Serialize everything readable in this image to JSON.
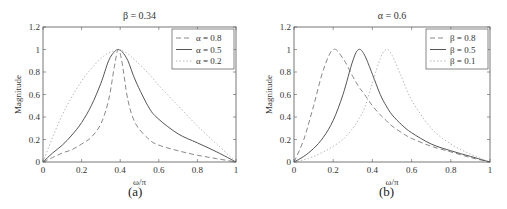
{
  "chart_data": [
    {
      "type": "line",
      "panel_label": "(a)",
      "title": "β = 0.34",
      "xlabel": "ω/π",
      "ylabel": "Magnitude",
      "xlim": [
        0,
        1
      ],
      "ylim": [
        0,
        1.2
      ],
      "xticks": [
        "0",
        "0.2",
        "0.4",
        "0.6",
        "0.8",
        "1"
      ],
      "yticks": [
        "0",
        "0.2",
        "0.4",
        "0.6",
        "0.8",
        "1",
        "1.2"
      ],
      "grid": false,
      "legend_position": "upper right",
      "x": [
        0,
        0.05,
        0.1,
        0.15,
        0.2,
        0.25,
        0.3,
        0.34,
        0.37,
        0.39,
        0.41,
        0.44,
        0.48,
        0.55,
        0.6,
        0.7,
        0.8,
        0.9,
        1.0
      ],
      "series": [
        {
          "name": "α = 0.8",
          "style": "dashed",
          "color": "#888888",
          "values": [
            0,
            0.04,
            0.08,
            0.11,
            0.16,
            0.22,
            0.34,
            0.55,
            0.85,
            1.0,
            0.88,
            0.55,
            0.34,
            0.2,
            0.15,
            0.1,
            0.06,
            0.03,
            0
          ]
        },
        {
          "name": "α = 0.5",
          "style": "solid",
          "color": "#555555",
          "values": [
            0,
            0.08,
            0.15,
            0.24,
            0.35,
            0.5,
            0.7,
            0.9,
            0.98,
            1.0,
            0.98,
            0.9,
            0.72,
            0.48,
            0.38,
            0.25,
            0.17,
            0.09,
            0
          ]
        },
        {
          "name": "α = 0.2",
          "style": "dotted",
          "color": "#bbbbbb",
          "values": [
            0,
            0.22,
            0.42,
            0.58,
            0.72,
            0.83,
            0.92,
            0.97,
            0.99,
            1.0,
            0.99,
            0.96,
            0.9,
            0.78,
            0.68,
            0.5,
            0.32,
            0.16,
            0
          ]
        }
      ]
    },
    {
      "type": "line",
      "panel_label": "(b)",
      "title": "α = 0.6",
      "xlabel": "ω/π",
      "ylabel": "Magnitude",
      "xlim": [
        0,
        1
      ],
      "ylim": [
        0,
        1.2
      ],
      "xticks": [
        "0",
        "0.2",
        "0.4",
        "0.6",
        "0.8",
        "1"
      ],
      "yticks": [
        "0",
        "0.2",
        "0.4",
        "0.6",
        "0.8",
        "1",
        "1.2"
      ],
      "grid": false,
      "legend_position": "upper right",
      "x": [
        0,
        0.05,
        0.1,
        0.15,
        0.2,
        0.25,
        0.3,
        0.33,
        0.36,
        0.4,
        0.44,
        0.47,
        0.5,
        0.55,
        0.6,
        0.7,
        0.8,
        0.9,
        1.0
      ],
      "series": [
        {
          "name": "β = 0.8",
          "style": "dashed",
          "color": "#888888",
          "values": [
            0,
            0.2,
            0.5,
            0.82,
            1.0,
            0.92,
            0.76,
            0.67,
            0.6,
            0.5,
            0.42,
            0.37,
            0.32,
            0.26,
            0.21,
            0.14,
            0.09,
            0.04,
            0
          ]
        },
        {
          "name": "β = 0.5",
          "style": "solid",
          "color": "#555555",
          "values": [
            0,
            0.05,
            0.12,
            0.22,
            0.37,
            0.6,
            0.9,
            1.0,
            0.95,
            0.78,
            0.6,
            0.5,
            0.42,
            0.33,
            0.26,
            0.16,
            0.1,
            0.05,
            0
          ]
        },
        {
          "name": "β = 0.1",
          "style": "dotted",
          "color": "#bbbbbb",
          "values": [
            0,
            0.02,
            0.05,
            0.09,
            0.14,
            0.2,
            0.3,
            0.38,
            0.48,
            0.7,
            0.92,
            1.0,
            0.95,
            0.75,
            0.55,
            0.3,
            0.16,
            0.07,
            0
          ]
        }
      ]
    }
  ]
}
